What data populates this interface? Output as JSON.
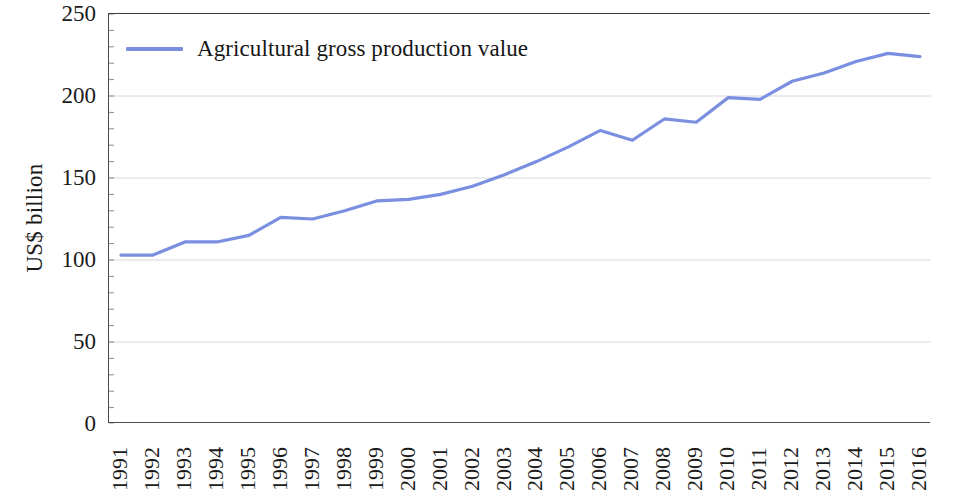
{
  "chart_data": {
    "type": "line",
    "title": "",
    "xlabel": "",
    "ylabel": "US$ billion",
    "ylim": [
      0,
      250
    ],
    "yticks": [
      0,
      50,
      100,
      150,
      200,
      250
    ],
    "grid": true,
    "legend_position": "top-left-inside",
    "line_color": "#7a8fe0",
    "categories": [
      "1991",
      "1992",
      "1993",
      "1994",
      "1995",
      "1996",
      "1997",
      "1998",
      "1999",
      "2000",
      "2001",
      "2002",
      "2003",
      "2004",
      "2005",
      "2006",
      "2007",
      "2008",
      "2009",
      "2010",
      "2011",
      "2012",
      "2013",
      "2014",
      "2015",
      "2016"
    ],
    "series": [
      {
        "name": "Agricultural gross production value",
        "values": [
          103,
          103,
          111,
          111,
          115,
          126,
          125,
          130,
          136,
          137,
          140,
          145,
          152,
          160,
          169,
          179,
          173,
          186,
          184,
          199,
          198,
          209,
          214,
          221,
          226,
          224
        ]
      }
    ]
  },
  "legend": {
    "entries": [
      {
        "label": "Agricultural gross production value",
        "color": "#7a8fe0",
        "marker": "line-swatch"
      }
    ]
  },
  "axes": {
    "y_axis_title": "US$ billion",
    "y_tick_labels": [
      "250",
      "200",
      "150",
      "100",
      "50",
      "0"
    ],
    "x_tick_labels": [
      "1991",
      "1992",
      "1993",
      "1994",
      "1995",
      "1996",
      "1997",
      "1998",
      "1999",
      "2000",
      "2001",
      "2002",
      "2003",
      "2004",
      "2005",
      "2006",
      "2007",
      "2008",
      "2009",
      "2010",
      "2011",
      "2012",
      "2013",
      "2014",
      "2015",
      "2016"
    ]
  }
}
